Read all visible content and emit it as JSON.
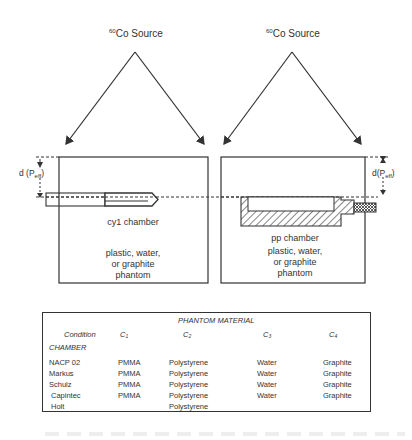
{
  "diagram": {
    "left_setup": {
      "source_label": "Co Source",
      "source_isotope_mass": "60",
      "depth_label": "d (P",
      "depth_subscript": "eff",
      "depth_label_close": ")",
      "chamber_label": "cy1 chamber",
      "phantom_label_lines": [
        "plastic, water,",
        "or graphite",
        "phantom"
      ]
    },
    "right_setup": {
      "source_label": "Co Source",
      "source_isotope_mass": "60",
      "depth_label": "d(P",
      "depth_subscript": "eff",
      "depth_label_close": ")",
      "chamber_label": "pp chamber",
      "phantom_label_lines": [
        "plastic, water,",
        "or graphite",
        "phantom"
      ]
    },
    "colors": {
      "line": "#333333",
      "background": "#ffffff"
    }
  },
  "table": {
    "title": "PHANTOM MATERIAL",
    "condition_header": "Condition",
    "columns": [
      {
        "base": "C",
        "sub": "1"
      },
      {
        "base": "C",
        "sub": "2"
      },
      {
        "base": "C",
        "sub": "3"
      },
      {
        "base": "C",
        "sub": "4"
      }
    ],
    "row_group_label": "CHAMBER",
    "rows": [
      {
        "chamber": "NACP 02",
        "c1": "PMMA",
        "c2": "Polystyrene",
        "c3": "Water",
        "c4": "Graphite"
      },
      {
        "chamber": "Markus",
        "c1": "PMMA",
        "c2": "Polystyrene",
        "c3": "Water",
        "c4": "Graphite"
      },
      {
        "chamber": "Schulz",
        "c1": "PMMA",
        "c2": "Polystyrene",
        "c3": "Water",
        "c4": "Graphite"
      },
      {
        "chamber": "Capintec",
        "c1": "PMMA",
        "c2": "Polystyrene",
        "c3": "Water",
        "c4": "Graphite"
      },
      {
        "chamber": "Holt",
        "c1": "",
        "c2": "Polystyrene",
        "c3": "",
        "c4": ""
      }
    ]
  }
}
